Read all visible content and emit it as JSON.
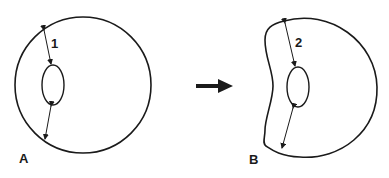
{
  "diagram": {
    "panels": [
      {
        "id": "A",
        "label": "A",
        "shape": "circle",
        "measure_label": "1"
      },
      {
        "id": "B",
        "label": "B",
        "shape": "indented-kidney",
        "measure_label": "2"
      }
    ],
    "transition_arrow": "right-arrow",
    "colors": {
      "stroke": "#1a1a1a",
      "background": "#ffffff"
    }
  }
}
